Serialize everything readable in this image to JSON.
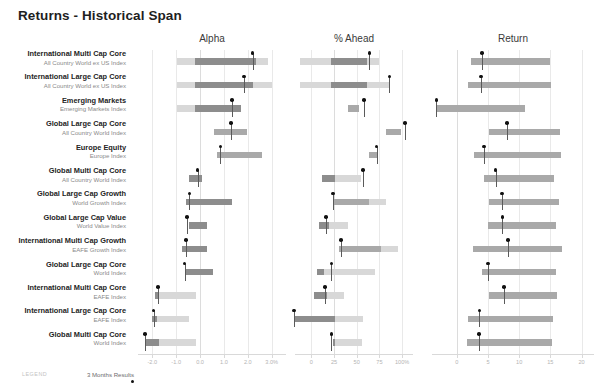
{
  "title": "Returns - Historical Span",
  "legend": {
    "word": "LEGEND",
    "label": "3 Months Results",
    "marker": "dot-marker"
  },
  "rows": [
    {
      "name": "International Multi Cap Core",
      "sub": "All Country World ex US Index"
    },
    {
      "name": "International Large Cap Core",
      "sub": "All Country World ex US Index"
    },
    {
      "name": "Emerging Markets",
      "sub": "Emerging Markets Index"
    },
    {
      "name": "Global Large Cap Core",
      "sub": "All Country World Index"
    },
    {
      "name": "Europe Equity",
      "sub": "Europe Index"
    },
    {
      "name": "Global Multi Cap Core",
      "sub": "All Country World Index"
    },
    {
      "name": "Global Large Cap Growth",
      "sub": "World Growth Index"
    },
    {
      "name": "Global Large Cap Value",
      "sub": "World Value Index"
    },
    {
      "name": "International Multi Cap Growth",
      "sub": "EAFE Growth Index"
    },
    {
      "name": "Global Large Cap Core",
      "sub": "World Index"
    },
    {
      "name": "International Multi Cap Core",
      "sub": "EAFE Index"
    },
    {
      "name": "International Large Cap Core",
      "sub": "EAFE Index"
    },
    {
      "name": "Global Multi Cap Core",
      "sub": "World Index"
    }
  ],
  "chart_data": [
    {
      "type": "bar",
      "title": "Alpha",
      "xlabel": "",
      "ylabel": "",
      "xlim": [
        -2.6,
        3.6
      ],
      "ticks": [
        -2.0,
        -1.0,
        0.0,
        1.0,
        2.0,
        3.0
      ],
      "tick_labels": [
        "-2.0",
        "-1.0",
        "0.0",
        "1.0",
        "2.0",
        "3.0%"
      ],
      "zero": 0.0,
      "grid": true,
      "series": [
        {
          "row": 0,
          "low": -0.95,
          "mid_low": -0.2,
          "mid_high": 2.35,
          "high": 2.85,
          "marker": 2.2
        },
        {
          "row": 1,
          "low": -0.95,
          "mid_low": -0.2,
          "mid_high": 2.2,
          "high": 3.0,
          "marker": 1.85
        },
        {
          "row": 2,
          "low": -0.95,
          "mid_low": -0.2,
          "mid_high": 1.7,
          "high": 1.7,
          "marker": 1.35
        },
        {
          "row": 3,
          "low": 0.6,
          "mid_low": 0.6,
          "mid_high": 1.95,
          "high": 1.95,
          "marker": 1.3
        },
        {
          "row": 4,
          "low": 0.7,
          "mid_low": 0.7,
          "mid_high": 2.6,
          "high": 2.6,
          "marker": 0.85
        },
        {
          "row": 5,
          "low": -0.45,
          "mid_low": -0.45,
          "mid_high": 0.1,
          "high": 0.1,
          "marker": -0.1
        },
        {
          "row": 6,
          "low": -0.6,
          "mid_low": -0.6,
          "mid_high": 1.35,
          "high": 1.35,
          "marker": -0.45
        },
        {
          "row": 7,
          "low": -0.45,
          "mid_low": -0.45,
          "mid_high": 0.3,
          "high": 0.3,
          "marker": -0.55
        },
        {
          "row": 8,
          "low": -0.75,
          "mid_low": -0.75,
          "mid_high": 0.3,
          "high": 0.3,
          "marker": -0.6
        },
        {
          "row": 9,
          "low": -0.6,
          "mid_low": -0.6,
          "mid_high": 0.55,
          "high": 0.55,
          "marker": -0.65
        },
        {
          "row": 10,
          "low": -1.9,
          "mid_low": -1.9,
          "mid_high": -1.7,
          "high": -0.15,
          "marker": -1.75
        },
        {
          "row": 11,
          "low": -2.0,
          "mid_low": -2.0,
          "mid_high": -1.8,
          "high": -0.45,
          "marker": -1.95
        },
        {
          "row": 12,
          "low": -2.25,
          "mid_low": -2.25,
          "mid_high": -1.7,
          "high": -0.15,
          "marker": -2.3
        }
      ]
    },
    {
      "type": "bar",
      "title": "% Ahead",
      "xlabel": "",
      "ylabel": "",
      "xlim": [
        -18,
        112
      ],
      "ticks": [
        0,
        25,
        50,
        75,
        100
      ],
      "tick_labels": [
        "0",
        "25",
        "50",
        "75",
        "100%"
      ],
      "zero": 25,
      "grid": true,
      "series": [
        {
          "row": 0,
          "low": -12,
          "mid_low": 22,
          "mid_high": 61,
          "high": 75,
          "marker": 64
        },
        {
          "row": 1,
          "low": -12,
          "mid_low": 22,
          "mid_high": 61,
          "high": 86,
          "marker": 86
        },
        {
          "row": 2,
          "low": 40,
          "mid_low": 40,
          "mid_high": 52,
          "high": 52,
          "marker": 58
        },
        {
          "row": 3,
          "low": 82,
          "mid_low": 82,
          "mid_high": 99,
          "high": 99,
          "marker": 103
        },
        {
          "row": 4,
          "low": 63,
          "mid_low": 63,
          "mid_high": 73,
          "high": 73,
          "marker": 72
        },
        {
          "row": 5,
          "low": 12,
          "mid_low": 12,
          "mid_high": 26,
          "high": 55,
          "marker": 57
        },
        {
          "row": 6,
          "low": 25,
          "mid_low": 25,
          "mid_high": 64,
          "high": 82,
          "marker": 24
        },
        {
          "row": 7,
          "low": 8,
          "mid_low": 8,
          "mid_high": 19,
          "high": 40,
          "marker": 16
        },
        {
          "row": 8,
          "low": 30,
          "mid_low": 30,
          "mid_high": 77,
          "high": 96,
          "marker": 33
        },
        {
          "row": 9,
          "low": 6,
          "mid_low": 6,
          "mid_high": 14,
          "high": 70,
          "marker": 22
        },
        {
          "row": 10,
          "low": 3,
          "mid_low": 3,
          "mid_high": 17,
          "high": 36,
          "marker": 15
        },
        {
          "row": 11,
          "low": -18,
          "mid_low": -18,
          "mid_high": 26,
          "high": 57,
          "marker": -19
        },
        {
          "row": 12,
          "low": 24,
          "mid_low": 24,
          "mid_high": 26,
          "high": 56,
          "marker": 22
        }
      ]
    },
    {
      "type": "bar",
      "title": "Return",
      "xlabel": "",
      "ylabel": "",
      "xlim": [
        -4,
        22
      ],
      "ticks": [
        0,
        5,
        10,
        15,
        20
      ],
      "tick_labels": [
        "0",
        "5",
        "10",
        "15",
        "20"
      ],
      "zero": 0,
      "grid": true,
      "series": [
        {
          "row": 0,
          "low": 2.2,
          "mid_low": 2.2,
          "mid_high": 15.0,
          "high": 15.0,
          "marker": 4.0
        },
        {
          "row": 1,
          "low": 1.8,
          "mid_low": 1.8,
          "mid_high": 15.1,
          "high": 15.1,
          "marker": 3.9
        },
        {
          "row": 2,
          "low": -3.3,
          "mid_low": -3.3,
          "mid_high": 11.0,
          "high": 11.0,
          "marker": -3.3
        },
        {
          "row": 3,
          "low": 5.2,
          "mid_low": 5.2,
          "mid_high": 16.6,
          "high": 16.6,
          "marker": 8.0
        },
        {
          "row": 4,
          "low": 2.7,
          "mid_low": 2.7,
          "mid_high": 16.7,
          "high": 16.7,
          "marker": 4.3
        },
        {
          "row": 5,
          "low": 4.4,
          "mid_low": 4.4,
          "mid_high": 15.6,
          "high": 15.6,
          "marker": 6.2
        },
        {
          "row": 6,
          "low": 5.1,
          "mid_low": 5.1,
          "mid_high": 16.4,
          "high": 16.4,
          "marker": 7.2
        },
        {
          "row": 7,
          "low": 5.0,
          "mid_low": 5.0,
          "mid_high": 15.9,
          "high": 15.9,
          "marker": 7.3
        },
        {
          "row": 8,
          "low": 2.5,
          "mid_low": 2.5,
          "mid_high": 16.9,
          "high": 16.9,
          "marker": 8.2
        },
        {
          "row": 9,
          "low": 4.1,
          "mid_low": 4.1,
          "mid_high": 15.9,
          "high": 15.9,
          "marker": 5.0
        },
        {
          "row": 10,
          "low": 5.1,
          "mid_low": 5.1,
          "mid_high": 16.0,
          "high": 16.0,
          "marker": 7.6
        },
        {
          "row": 11,
          "low": 1.7,
          "mid_low": 1.7,
          "mid_high": 15.4,
          "high": 15.4,
          "marker": 3.6
        },
        {
          "row": 12,
          "low": 1.6,
          "mid_low": 1.6,
          "mid_high": 15.2,
          "high": 15.2,
          "marker": 3.5
        }
      ]
    }
  ]
}
